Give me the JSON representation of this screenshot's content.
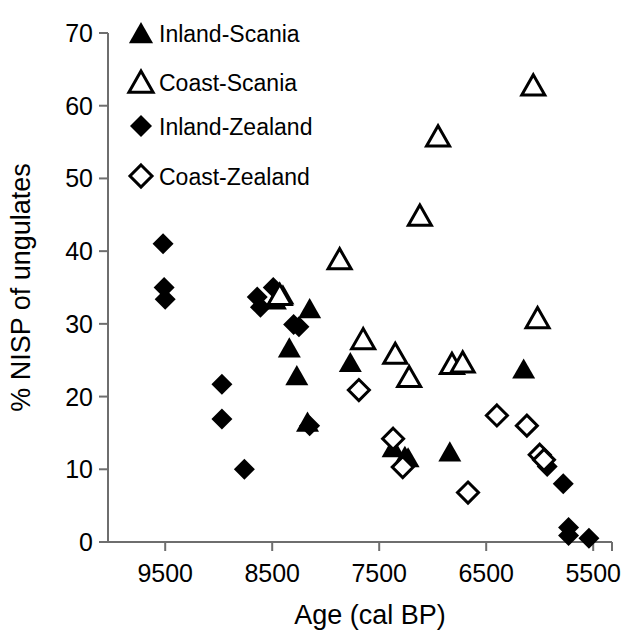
{
  "chart_data": {
    "type": "scatter",
    "title": "",
    "xlabel": "Age  (cal BP)",
    "ylabel": "% NISP of ungulates",
    "xlim": [
      10100,
      5380
    ],
    "ylim": [
      0,
      70
    ],
    "x_ticks": [
      9500,
      8500,
      7500,
      6500,
      5500
    ],
    "y_ticks": [
      0,
      10,
      20,
      30,
      40,
      50,
      60,
      70
    ],
    "x_tick_labels": [
      "9500",
      "8500",
      "7500",
      "6500",
      "5500"
    ],
    "y_tick_labels": [
      "0",
      "10",
      "20",
      "30",
      "40",
      "50",
      "60",
      "70"
    ],
    "grid": false,
    "x_axis_reversed": true,
    "legend_position": "top-left",
    "series": [
      {
        "name": "Inland-Scania",
        "marker": "triangle-filled",
        "color": "#000000",
        "points": [
          [
            8470,
            33.3
          ],
          [
            8400,
            34.0
          ],
          [
            8340,
            26.7
          ],
          [
            8270,
            22.9
          ],
          [
            8170,
            16.5
          ],
          [
            8150,
            32.1
          ],
          [
            7770,
            24.7
          ],
          [
            7370,
            13.0
          ],
          [
            7260,
            11.8
          ],
          [
            7230,
            11.6
          ],
          [
            6840,
            12.4
          ],
          [
            6150,
            23.8
          ]
        ]
      },
      {
        "name": "Coast-Scania",
        "marker": "triangle-open",
        "color": "#000000",
        "points": [
          [
            8430,
            34.0
          ],
          [
            7870,
            38.9
          ],
          [
            7650,
            27.9
          ],
          [
            7350,
            25.9
          ],
          [
            7220,
            22.7
          ],
          [
            7120,
            44.9
          ],
          [
            6950,
            55.8
          ],
          [
            6820,
            24.5
          ],
          [
            6720,
            24.7
          ],
          [
            6060,
            62.8
          ],
          [
            6020,
            30.8
          ]
        ]
      },
      {
        "name": "Inland-Zealand",
        "marker": "diamond-filled",
        "color": "#000000",
        "points": [
          [
            9520,
            41.0
          ],
          [
            9510,
            35.0
          ],
          [
            9500,
            33.4
          ],
          [
            8970,
            21.7
          ],
          [
            8970,
            16.9
          ],
          [
            8640,
            33.7
          ],
          [
            8610,
            32.3
          ],
          [
            8490,
            35.0
          ],
          [
            8300,
            29.9
          ],
          [
            8250,
            29.6
          ],
          [
            8150,
            16.0
          ],
          [
            8760,
            10.0
          ],
          [
            5930,
            10.4
          ],
          [
            5780,
            8.0
          ],
          [
            5730,
            2.0
          ],
          [
            5730,
            0.9
          ],
          [
            5540,
            0.5
          ]
        ]
      },
      {
        "name": "Coast-Zealand",
        "marker": "diamond-open",
        "color": "#000000",
        "points": [
          [
            7690,
            20.9
          ],
          [
            7370,
            14.2
          ],
          [
            7280,
            10.3
          ],
          [
            6670,
            6.8
          ],
          [
            6400,
            17.4
          ],
          [
            6120,
            16.0
          ],
          [
            6000,
            12.0
          ],
          [
            5960,
            11.3
          ]
        ]
      }
    ]
  },
  "legend": {
    "items": [
      {
        "label": "Inland-Scania",
        "marker": "triangle-filled"
      },
      {
        "label": "Coast-Scania",
        "marker": "triangle-open"
      },
      {
        "label": "Inland-Zealand",
        "marker": "diamond-filled"
      },
      {
        "label": "Coast-Zealand",
        "marker": "diamond-open"
      }
    ]
  },
  "axes": {
    "x_title": "Age  (cal BP)",
    "y_title": "% NISP of ungulates"
  }
}
